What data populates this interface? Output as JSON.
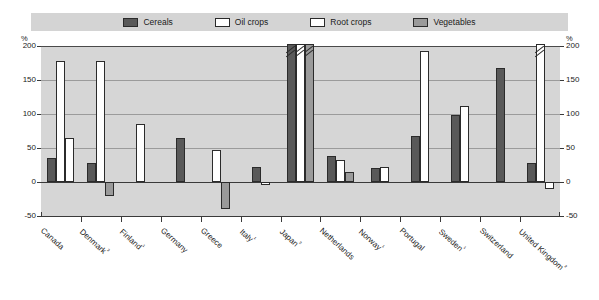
{
  "legend": {
    "items": [
      {
        "label": "Cereals",
        "key": "cereals",
        "color": "#595959"
      },
      {
        "label": "Oil crops",
        "key": "oil_crops",
        "color": "#ffffff"
      },
      {
        "label": "Root crops",
        "key": "root_crops",
        "color": "#ffffff"
      },
      {
        "label": "Vegetables",
        "key": "vegetables",
        "color": "#9a9a9a"
      }
    ]
  },
  "axis": {
    "unit_left": "%",
    "unit_right": "%",
    "yticks": [
      "200",
      "150",
      "100",
      "50",
      "0",
      "-50"
    ],
    "yticks_right": [
      "200",
      "150",
      "100",
      "50",
      "0",
      "-50"
    ]
  },
  "chart_data": {
    "type": "bar",
    "title": "",
    "subtitle": "",
    "xlabel": "",
    "ylabel": "%",
    "ylim": [
      -50,
      200
    ],
    "yticks": [
      -50,
      0,
      50,
      100,
      150,
      200
    ],
    "grid": true,
    "legend_position": "top",
    "note": "Bars marked exceeding 200% are drawn with axis-break hatch marks at the top of the plot",
    "categories": [
      "Canada",
      "Denmark²",
      "Finland¹",
      "Germany",
      "Greece",
      "Italy¹",
      "Japan²",
      "Netherlands",
      "Norway¹",
      "Portugal",
      "Sweden¹",
      "Switzerland",
      "United Kingdom²"
    ],
    "series": [
      {
        "name": "Cereals",
        "color": "#595959",
        "values": [
          35,
          28,
          null,
          65,
          null,
          22,
          230,
          38,
          20,
          68,
          99,
          168,
          28
        ]
      },
      {
        "name": "Oil crops",
        "color": "#ffffff",
        "values": [
          178,
          178,
          85,
          null,
          47,
          null,
          240,
          33,
          null,
          193,
          112,
          null,
          250
        ]
      },
      {
        "name": "Root crops",
        "color": "#ffffff",
        "values": [
          65,
          null,
          null,
          null,
          null,
          -5,
          null,
          null,
          22,
          null,
          null,
          null,
          -10
        ]
      },
      {
        "name": "Vegetables",
        "color": "#9a9a9a",
        "values": [
          null,
          -20,
          null,
          null,
          -40,
          null,
          225,
          15,
          null,
          null,
          null,
          null,
          null
        ]
      }
    ]
  }
}
